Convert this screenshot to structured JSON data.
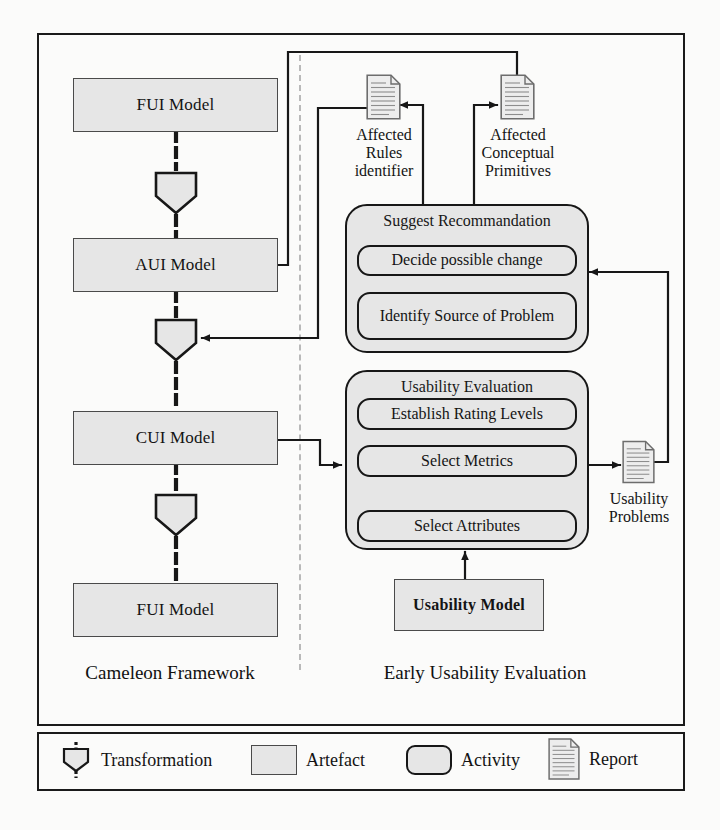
{
  "diagram": {
    "sections": {
      "left_label": "Cameleon Framework",
      "right_label": "Early Usability Evaluation"
    },
    "artefacts": {
      "fui_top": "FUI Model",
      "aui": "AUI Model",
      "cui": "CUI Model",
      "fui_bottom": "FUI Model",
      "usability_model": "Usability Model"
    },
    "activity_groups": {
      "suggest": {
        "title": "Suggest Recommandation",
        "steps": [
          "Decide possible change",
          "Identify Source of Problem"
        ]
      },
      "evaluation": {
        "title": "Usability Evaluation",
        "steps": [
          "Establish Rating Levels",
          "Select Metrics",
          "Select Attributes"
        ]
      }
    },
    "reports": {
      "affected_rules": "Affected Rules identifier",
      "affected_rules_lines": [
        "Affected",
        "Rules",
        "identifier"
      ],
      "affected_primitives": "Affected Conceptual Primitives",
      "affected_primitives_lines": [
        "Affected",
        "Conceptual",
        "Primitives"
      ],
      "usability_problems": "Usability Problems",
      "usability_problems_lines": [
        "Usability",
        "Problems"
      ]
    },
    "legend": [
      {
        "icon": "transformation-icon",
        "label": "Transformation"
      },
      {
        "icon": "artefact-icon",
        "label": "Artefact"
      },
      {
        "icon": "activity-icon",
        "label": "Activity"
      },
      {
        "icon": "report-icon",
        "label": "Report"
      }
    ],
    "colors": {
      "fill": "#e6e6e6",
      "stroke": "#171717",
      "artefact_stroke": "#4a4a4a",
      "divider": "#b9b9b9",
      "background": "#fbfbfa"
    }
  }
}
